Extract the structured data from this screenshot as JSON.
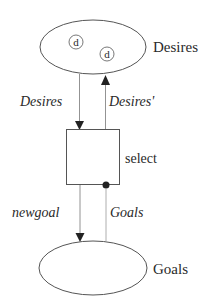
{
  "diagram": {
    "nodes": {
      "desires_store": {
        "label": "Desires",
        "items": [
          "d",
          "d"
        ]
      },
      "select_process": {
        "label": "select"
      },
      "goals_store": {
        "label": "Goals"
      }
    },
    "edges": {
      "desires_in": {
        "label": "Desires",
        "from": "Desires",
        "to": "select"
      },
      "desires_out": {
        "label": "Desires'",
        "from": "select",
        "to": "Desires"
      },
      "newgoal": {
        "label": "newgoal",
        "from": "select",
        "to": "Goals"
      },
      "goals_read": {
        "label": "Goals",
        "from": "Goals",
        "to": "select"
      }
    },
    "colors": {
      "stroke": "#555555",
      "text": "#2a2a2a",
      "arrowhead": "#222222"
    }
  }
}
